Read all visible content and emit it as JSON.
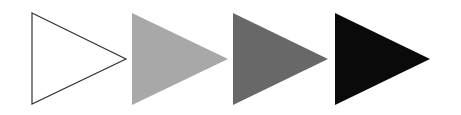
{
  "diagram": {
    "triangles": [
      {
        "id": "outline",
        "fill": "#ffffff",
        "stroke": "#333333",
        "stroke_width": 1.2,
        "points": "32,13 126,59 32,104"
      },
      {
        "id": "light-gray",
        "fill": "#a8a8a8",
        "stroke": "none",
        "stroke_width": 0,
        "points": "132,13 228,59 132,105"
      },
      {
        "id": "dark-gray",
        "fill": "#686868",
        "stroke": "none",
        "stroke_width": 0,
        "points": "233,13 328,59 233,105"
      },
      {
        "id": "black",
        "fill": "#0a0a0a",
        "stroke": "none",
        "stroke_width": 0,
        "points": "335,13 430,59 335,105"
      }
    ]
  }
}
